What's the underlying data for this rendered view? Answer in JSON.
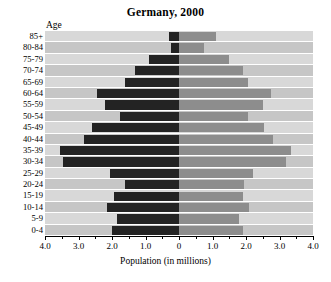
{
  "chart_data": {
    "type": "bar",
    "subtype": "population-pyramid",
    "title": "Germany, 2000",
    "xlabel": "Population (in millions)",
    "ylabel": "Age",
    "xlim": [
      -4.0,
      4.0
    ],
    "xticks": [
      "4.0",
      "3.0",
      "2.0",
      "1.0",
      "0",
      "1.0",
      "2.0",
      "3.0",
      "4.0"
    ],
    "xtick_values": [
      -4.0,
      -3.0,
      -2.0,
      -1.0,
      0,
      1.0,
      2.0,
      3.0,
      4.0
    ],
    "minor_tick_step": 0.5,
    "grid": true,
    "legend_position": "inside-top",
    "categories": [
      "85+",
      "80-84",
      "75-79",
      "70-74",
      "65-69",
      "60-64",
      "55-59",
      "50-54",
      "45-49",
      "40-44",
      "35-39",
      "30-34",
      "25-29",
      "20-24",
      "15-19",
      "10-14",
      "5-9",
      "0-4"
    ],
    "series": [
      {
        "name": "Males",
        "color": "#232323",
        "direction": "left",
        "values": [
          0.3,
          0.25,
          0.9,
          1.3,
          1.6,
          2.45,
          2.2,
          1.75,
          2.6,
          2.85,
          3.55,
          3.45,
          2.05,
          1.6,
          1.95,
          2.15,
          1.85,
          2.0
        ]
      },
      {
        "name": "Females",
        "color": "#8d8d8d",
        "direction": "right",
        "values": [
          1.1,
          0.75,
          1.5,
          1.9,
          2.05,
          2.75,
          2.5,
          2.05,
          2.55,
          2.8,
          3.35,
          3.2,
          2.2,
          1.95,
          1.9,
          2.1,
          1.8,
          1.9
        ]
      }
    ]
  },
  "labels": {
    "males": "Males",
    "females": "Females",
    "age_axis": "Age"
  }
}
